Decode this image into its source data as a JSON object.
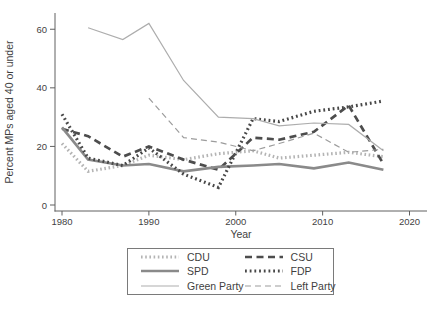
{
  "figure": {
    "background": "#ffffff",
    "text_color": "#3f3f3f",
    "axis_color": "#606060"
  },
  "chart_data": {
    "type": "line",
    "title": "",
    "xlabel": "Year",
    "ylabel": "Percent MPs aged 40 or under",
    "x_ticks": [
      1980,
      1990,
      2000,
      2010,
      2020
    ],
    "y_ticks": [
      0,
      20,
      40,
      60
    ],
    "xlim": [
      1979,
      2022
    ],
    "ylim": [
      0,
      66
    ],
    "grid": false,
    "legend_position": "bottom-center",
    "x": [
      1980,
      1983,
      1987,
      1990,
      1994,
      1998,
      2002,
      2005,
      2009,
      2013,
      2017
    ],
    "series": [
      {
        "name": "CDU",
        "color": "#b4b4b4",
        "width": 3.2,
        "dash": "1.6 2.6",
        "values": [
          21,
          11.5,
          13.5,
          17,
          15.5,
          17.5,
          18.5,
          16,
          17,
          18,
          16.5
        ]
      },
      {
        "name": "CSU",
        "color": "#4d4d4d",
        "width": 2.7,
        "dash": "7 4.5",
        "values": [
          26,
          23.5,
          16.5,
          20,
          15.5,
          12,
          23,
          22.3,
          25,
          34,
          14
        ]
      },
      {
        "name": "SPD",
        "color": "#8a8a8a",
        "width": 2.7,
        "dash": "",
        "values": [
          26.5,
          15.5,
          13.5,
          14,
          11.5,
          13,
          13.5,
          14,
          12.5,
          14.5,
          12
        ]
      },
      {
        "name": "FDP",
        "color": "#484848",
        "width": 3.2,
        "dash": "1.8 2.9",
        "values": [
          31,
          16,
          13.5,
          19.5,
          10.5,
          6,
          29.5,
          28.5,
          32,
          33.5,
          35.5
        ]
      },
      {
        "name": "Green Party",
        "color": "#adadad",
        "width": 1.2,
        "dash": "",
        "values": [
          null,
          60.5,
          56.5,
          62,
          42.5,
          30,
          29.5,
          27,
          28,
          27.5,
          18.5
        ]
      },
      {
        "name": "Left Party",
        "color": "#9c9c9c",
        "width": 1.2,
        "dash": "6 4",
        "values": [
          null,
          null,
          null,
          36.5,
          23,
          21.5,
          18.5,
          21,
          24.5,
          18,
          19
        ]
      }
    ]
  }
}
